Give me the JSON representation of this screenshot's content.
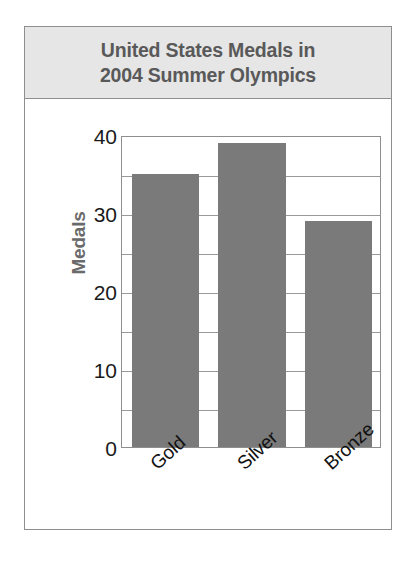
{
  "figure": {
    "title_lines": [
      "United States Medals in",
      "2004 Summer Olympics"
    ],
    "title_full": "United States Medals in 2004 Summer Olympics",
    "frame_color": "#8e8e8e",
    "title_band_color": "#e6e6e6",
    "title_text_color": "#595959"
  },
  "chart_data": {
    "type": "bar",
    "title": "United States Medals in 2004 Summer Olympics",
    "categories": [
      "Gold",
      "Silver",
      "Bronze"
    ],
    "values": [
      35,
      39,
      29
    ],
    "xlabel": "",
    "ylabel": "Medals",
    "ylim": [
      0,
      40
    ],
    "yticks": [
      0,
      10,
      20,
      30,
      40
    ],
    "ytick_labels": [
      "0",
      "10",
      "20",
      "30",
      "40"
    ],
    "gridlines": [
      5,
      10,
      15,
      20,
      25,
      30,
      35
    ],
    "grid": true,
    "grid_axis": "y",
    "legend": false,
    "bar_color": "#7a7a7a",
    "axis_label_color": "#6a6a6a",
    "tick_label_color": "#1a1a1a"
  }
}
